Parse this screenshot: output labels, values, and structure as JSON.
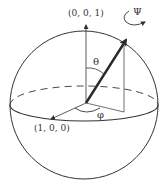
{
  "diagram": {
    "type": "bloch-sphere",
    "labels": {
      "z_axis": "(0, 0, 1)",
      "x_axis": "(1, 0, 0)",
      "theta": "θ",
      "phi": "φ",
      "psi": "Ψ"
    },
    "colors": {
      "line": "#333333",
      "vector": "#2a2a2a",
      "background": "#ffffff"
    }
  }
}
